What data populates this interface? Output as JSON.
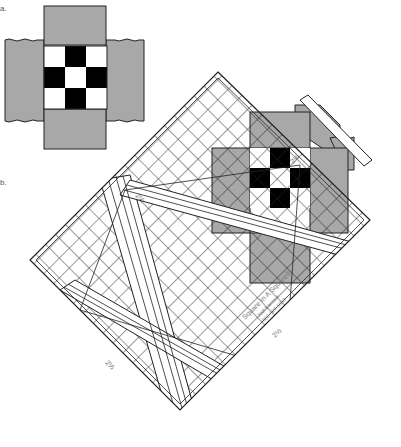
{
  "figure": {
    "step_labels": [
      {
        "id": "a",
        "text": "a.",
        "x": 0,
        "y": 6
      },
      {
        "id": "b",
        "text": "b.",
        "x": 0,
        "y": 180
      }
    ]
  },
  "block": {
    "name": "nine-patch",
    "strip_color": "#a8a8a8",
    "dark_color": "#000000",
    "light_color": "#ffffff",
    "pattern": [
      [
        "light",
        "dark",
        "light"
      ],
      [
        "dark",
        "light",
        "dark"
      ],
      [
        "light",
        "dark",
        "light"
      ]
    ]
  },
  "ruler": {
    "brand": "Square In A Square",
    "trademark": "®",
    "sub_line": "Jodi Barrows",
    "phone": "888-624-6350",
    "rotation_deg": -45,
    "corner_marks": [
      "2½",
      "2½",
      "2½",
      "2½"
    ]
  }
}
